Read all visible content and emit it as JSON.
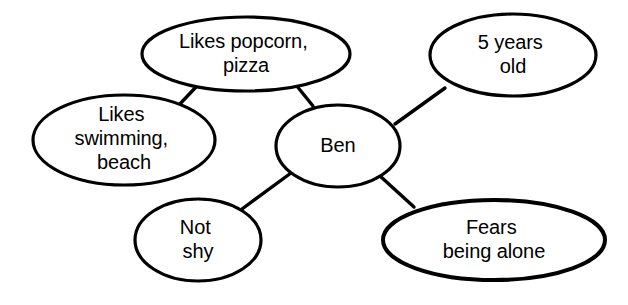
{
  "diagram": {
    "type": "concept-map",
    "background_color": "#ffffff",
    "stroke_color": "#000000",
    "text_color": "#000000",
    "center_node": {
      "id": "ben",
      "label": "Ben",
      "lines": [
        "Ben"
      ],
      "cx": 338,
      "cy": 146,
      "rx": 62,
      "ry": 41
    },
    "nodes": [
      {
        "id": "popcorn",
        "label": "Likes popcorn, pizza",
        "lines": [
          "Likes popcorn,",
          "pizza"
        ],
        "cx": 246,
        "cy": 54,
        "rx": 104,
        "ry": 37
      },
      {
        "id": "age",
        "label": "5 years old",
        "lines": [
          "5 years",
          "old"
        ],
        "cx": 513,
        "cy": 55,
        "rx": 83,
        "ry": 41
      },
      {
        "id": "swimming",
        "label": "Likes swimming, beach",
        "lines": [
          "Likes",
          "swimming,",
          "beach"
        ],
        "cx": 124,
        "cy": 140,
        "rx": 91,
        "ry": 45
      },
      {
        "id": "notshy",
        "label": "Not shy",
        "lines": [
          "Not",
          "shy"
        ],
        "cx": 198,
        "cy": 240,
        "rx": 63,
        "ry": 41
      },
      {
        "id": "fears",
        "label": "Fears being alone",
        "lines": [
          "Fears",
          "being alone"
        ],
        "cx": 494,
        "cy": 240,
        "rx": 111,
        "ry": 40
      }
    ],
    "edges": [
      {
        "id": "edge-popcorn-swimming",
        "from": "popcorn",
        "to": "swimming",
        "x1": 196,
        "y1": 87,
        "x2": 178,
        "y2": 106
      },
      {
        "id": "edge-popcorn-ben",
        "from": "popcorn",
        "to": "ben",
        "x1": 296,
        "y1": 85,
        "x2": 313,
        "y2": 106
      },
      {
        "id": "edge-ben-age",
        "from": "ben",
        "to": "age",
        "x1": 395,
        "y1": 124,
        "x2": 445,
        "y2": 88
      },
      {
        "id": "edge-ben-notshy",
        "from": "ben",
        "to": "notshy",
        "x1": 291,
        "y1": 173,
        "x2": 242,
        "y2": 209
      },
      {
        "id": "edge-ben-fears",
        "from": "ben",
        "to": "fears",
        "x1": 380,
        "y1": 176,
        "x2": 414,
        "y2": 207
      }
    ]
  }
}
